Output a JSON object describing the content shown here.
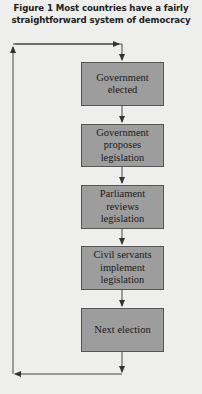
{
  "figure": {
    "title_line1": "Figure 1 Most countries have a fairly",
    "title_line2": "straightforward system of democracy"
  },
  "flow": {
    "steps": [
      {
        "line1": "Government",
        "line2": "elected",
        "line3": ""
      },
      {
        "line1": "Government",
        "line2": "proposes",
        "line3": "legislation"
      },
      {
        "line1": "Parliament",
        "line2": "reviews",
        "line3": "legislation"
      },
      {
        "line1": "Civil servants",
        "line2": "implement",
        "line3": "legislation"
      },
      {
        "line1": "Next election",
        "line2": "",
        "line3": ""
      }
    ],
    "loop": "Next election returns to Government elected"
  },
  "colors": {
    "background": "#eeeeec",
    "box_fill": "#9d9d9d",
    "line": "#333333"
  }
}
